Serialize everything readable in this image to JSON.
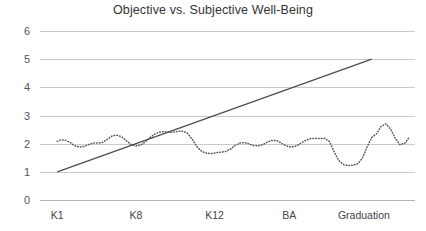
{
  "chart_data": {
    "type": "line",
    "title": "Objective vs. Subjective Well-Being",
    "xlabel": "",
    "ylabel": "",
    "ylim": [
      0,
      6
    ],
    "yticks": [
      0,
      1,
      2,
      3,
      4,
      5,
      6
    ],
    "ytick_labels": [
      "0",
      "1",
      "2",
      "3",
      "4",
      "5",
      "6"
    ],
    "grid": true,
    "legend": "none",
    "categories": [
      "K1",
      "K8",
      "K12",
      "BA",
      "Graduation"
    ],
    "category_positions": [
      0.0,
      1.0,
      2.0,
      2.95,
      3.9
    ],
    "xlim": [
      -0.22,
      4.55
    ],
    "series": [
      {
        "name": "Objective Well-Being",
        "style": "solid",
        "color": "#4f4f4f",
        "x": [
          0.0,
          4.0
        ],
        "values": [
          1.0,
          5.0
        ]
      },
      {
        "name": "Subjective Well-Being",
        "style": "dotted",
        "color": "#555555",
        "x": [
          0.0,
          0.05,
          0.1,
          0.16,
          0.22,
          0.28,
          0.34,
          0.4,
          0.46,
          0.52,
          0.58,
          0.64,
          0.7,
          0.76,
          0.82,
          0.88,
          0.94,
          1.0,
          1.06,
          1.12,
          1.18,
          1.24,
          1.3,
          1.36,
          1.42,
          1.48,
          1.54,
          1.6,
          1.66,
          1.72,
          1.78,
          1.84,
          1.9,
          1.96,
          2.02,
          2.08,
          2.14,
          2.2,
          2.26,
          2.32,
          2.38,
          2.44,
          2.5,
          2.56,
          2.62,
          2.68,
          2.74,
          2.8,
          2.86,
          2.92,
          2.98,
          3.04,
          3.1,
          3.16,
          3.22,
          3.28,
          3.34,
          3.4,
          3.46,
          3.52,
          3.58,
          3.64,
          3.7,
          3.76,
          3.82,
          3.88,
          3.94,
          4.0,
          4.06
        ],
        "values": [
          2.08,
          2.14,
          2.12,
          2.05,
          1.93,
          1.88,
          1.9,
          1.97,
          2.02,
          2.02,
          2.05,
          2.16,
          2.28,
          2.3,
          2.24,
          2.1,
          1.97,
          1.92,
          1.95,
          2.06,
          2.22,
          2.34,
          2.41,
          2.43,
          2.4,
          2.41,
          2.44,
          2.44,
          2.36,
          2.14,
          1.88,
          1.72,
          1.66,
          1.65,
          1.68,
          1.7,
          1.72,
          1.8,
          1.93,
          2.02,
          2.04,
          1.99,
          1.93,
          1.92,
          1.97,
          2.07,
          2.12,
          2.1,
          2.0,
          1.91,
          1.88,
          1.92,
          2.02,
          2.12,
          2.18,
          2.19,
          2.18,
          2.19,
          2.08,
          1.72,
          1.4,
          1.26,
          1.22,
          1.24,
          1.28,
          1.48,
          1.88,
          2.22,
          2.35
        ]
      }
    ],
    "series2_tail": {
      "x": [
        4.06,
        4.12,
        4.18,
        4.24,
        4.3,
        4.36,
        4.42,
        4.48
      ],
      "values": [
        2.35,
        2.62,
        2.7,
        2.52,
        2.18,
        1.96,
        2.02,
        2.24
      ]
    }
  },
  "axis": {
    "y_label_0": "0",
    "y_label_1": "1",
    "y_label_2": "2",
    "y_label_3": "3",
    "y_label_4": "4",
    "y_label_5": "5",
    "y_label_6": "6",
    "x_label_k1": "K1",
    "x_label_k8": "K8",
    "x_label_k12": "K12",
    "x_label_ba": "BA",
    "x_label_graduation": "Graduation"
  },
  "colors": {
    "grid": "#c9c9c9",
    "trend": "#4f4f4f",
    "subjective": "#555555",
    "title": "#333333",
    "background": "#ffffff"
  }
}
